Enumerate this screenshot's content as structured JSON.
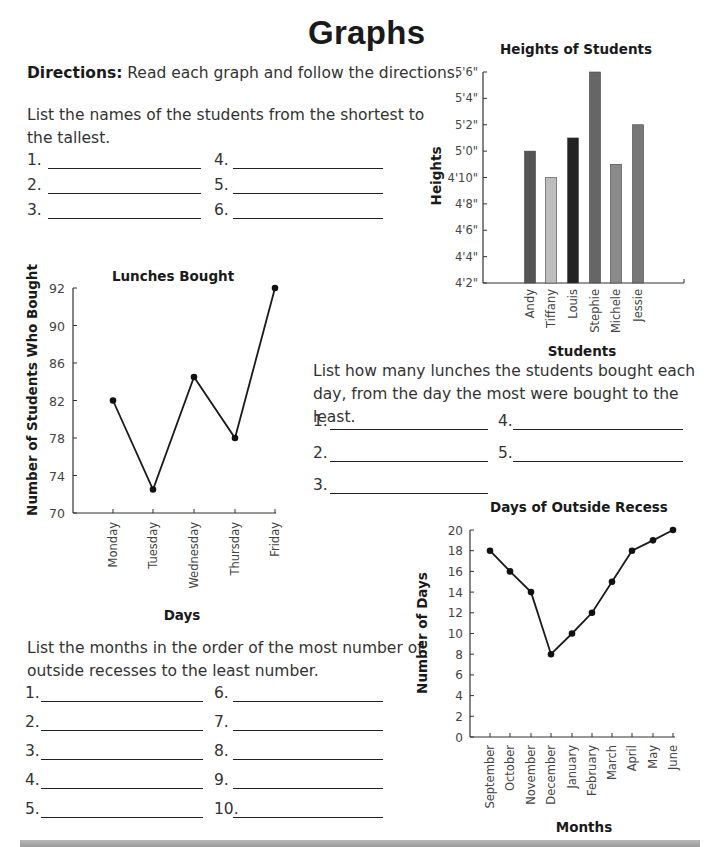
{
  "page": {
    "title": "Graphs",
    "directions_label": "Directions:",
    "directions_text": " Read each graph and follow the directions."
  },
  "questions": {
    "heights": {
      "prompt_line1": "List the names of the students from the shortest to",
      "prompt_line2": "the tallest.",
      "blanks": [
        "1.",
        "2.",
        "3.",
        "4.",
        "5.",
        "6."
      ]
    },
    "lunches": {
      "prompt_line1": "List how many lunches the students bought each",
      "prompt_line2": "day, from the day the most were bought to the least.",
      "blanks": [
        "1.",
        "2.",
        "3.",
        "4.",
        "5."
      ]
    },
    "recess": {
      "prompt_line1": "List the months in the order of the most number of",
      "prompt_line2": "outside recesses to the least number.",
      "blanks": [
        "1.",
        "2.",
        "3.",
        "4.",
        "5.",
        "6.",
        "7.",
        "8.",
        "9.",
        "10."
      ]
    }
  },
  "chart_data": [
    {
      "type": "bar",
      "title": "Heights of Students",
      "xlabel": "Students",
      "ylabel": "Heights",
      "categories": [
        "Andy",
        "Tiffany",
        "Louis",
        "Stephie",
        "Michele",
        "Jessie"
      ],
      "values_inches": [
        60,
        58,
        61,
        66,
        59,
        62
      ],
      "values_display": [
        "5'0\"",
        "4'10\"",
        "5'1\"",
        "5'6\"",
        "4'11\"",
        "5'2\""
      ],
      "bar_colors": [
        "#555555",
        "#bdbdbd",
        "#222222",
        "#666666",
        "#8a8a8a",
        "#777777"
      ],
      "yticks": [
        "4'2\"",
        "4'4\"",
        "4'6\"",
        "4'8\"",
        "4'10\"",
        "5'0\"",
        "5'2\"",
        "5'4\"",
        "5'6\""
      ],
      "ylim_inches": [
        50,
        66
      ],
      "grid": false
    },
    {
      "type": "line",
      "title": "Lunches Bought",
      "xlabel": "Days",
      "ylabel": "Number of Students Who Bought",
      "categories": [
        "Monday",
        "Tuesday",
        "Wednesday",
        "Thursday",
        "Friday"
      ],
      "values": [
        82,
        72.5,
        84.5,
        78,
        92
      ],
      "yticks": [
        "70",
        "74",
        "78",
        "82",
        "86",
        "90",
        "92"
      ],
      "ylim": [
        70,
        92
      ],
      "grid": false
    },
    {
      "type": "line",
      "title": "Days of Outside Recess",
      "xlabel": "Months",
      "ylabel": "Number of Days",
      "categories": [
        "September",
        "October",
        "November",
        "December",
        "January",
        "February",
        "March",
        "April",
        "May",
        "June"
      ],
      "values": [
        18,
        16,
        14,
        8,
        10,
        12,
        15,
        18,
        19,
        20
      ],
      "yticks": [
        "0",
        "2",
        "4",
        "6",
        "8",
        "10",
        "12",
        "14",
        "16",
        "18",
        "20"
      ],
      "ylim": [
        0,
        20
      ],
      "grid": false
    }
  ]
}
